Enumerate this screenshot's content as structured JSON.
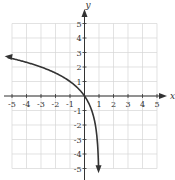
{
  "chart_data": {
    "type": "line",
    "title": "",
    "xlabel": "x",
    "ylabel": "y",
    "xlim": [
      -5,
      5
    ],
    "ylim": [
      -5,
      5
    ],
    "grid": true,
    "x_ticks": [
      -5,
      -4,
      -3,
      -2,
      -1,
      1,
      2,
      3,
      4,
      5
    ],
    "y_ticks": [
      -5,
      -4,
      -3,
      -2,
      -1,
      1,
      2,
      3,
      4,
      5
    ],
    "x_tick_labels": [
      "-5",
      "-4",
      "-3",
      "-2",
      "-1",
      "1",
      "2",
      "3",
      "4",
      "5"
    ],
    "y_tick_labels": [
      "-5",
      "-4",
      "-3",
      "-2",
      "-1",
      "1",
      "2",
      "3",
      "4",
      "5"
    ],
    "series": [
      {
        "name": "y = log2(1 - x)",
        "x": [
          -5.2,
          -5,
          -4,
          -3,
          -2,
          -1,
          0,
          0.5,
          0.75,
          0.875,
          0.9375,
          0.96875
        ],
        "y": [
          2.64,
          2.58,
          2.32,
          2.0,
          1.58,
          1.0,
          0.0,
          -1.0,
          -2.0,
          -3.0,
          -4.0,
          -5.0
        ],
        "arrows": [
          "start",
          "end"
        ],
        "color": "#333333"
      }
    ],
    "legend": null
  },
  "colors": {
    "grid": "#d6d6d6",
    "axis": "#333333",
    "curve": "#333333"
  }
}
